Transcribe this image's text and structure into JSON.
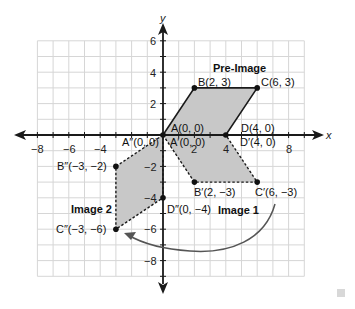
{
  "diagram": {
    "type": "coordinate-plane-transformation",
    "axes": {
      "x_label": "x",
      "y_label": "y",
      "x_ticks": [
        {
          "value": -8,
          "label": "−8"
        },
        {
          "value": -6,
          "label": "−6"
        },
        {
          "value": -4,
          "label": "−4"
        },
        {
          "value": 2,
          "label": "2"
        },
        {
          "value": 4,
          "label": "4"
        },
        {
          "value": 8,
          "label": "8"
        }
      ],
      "y_ticks": [
        {
          "value": 6,
          "label": "6"
        },
        {
          "value": 4,
          "label": "4"
        },
        {
          "value": 2,
          "label": "2"
        },
        {
          "value": -2,
          "label": "−2"
        },
        {
          "value": -4,
          "label": "−4"
        },
        {
          "value": -6,
          "label": "−6"
        },
        {
          "value": -8,
          "label": "−8"
        }
      ],
      "grid_x_range": [
        -8,
        9
      ],
      "grid_y_range": [
        -9,
        6
      ]
    },
    "shapes": {
      "pre_image": {
        "title": "Pre-Image",
        "vertices": [
          {
            "name": "A",
            "x": 0,
            "y": 0,
            "label": "A(0, 0)"
          },
          {
            "name": "B",
            "x": 2,
            "y": 3,
            "label": "B(2, 3)"
          },
          {
            "name": "C",
            "x": 6,
            "y": 3,
            "label": "C(6, 3)"
          },
          {
            "name": "D",
            "x": 4,
            "y": 0,
            "label": "D(4, 0)"
          }
        ]
      },
      "image_1": {
        "title": "Image 1",
        "vertices": [
          {
            "name": "A'",
            "x": 0,
            "y": 0,
            "label": "A′(0, 0)"
          },
          {
            "name": "B'",
            "x": 2,
            "y": -3,
            "label": "B′(2, −3)"
          },
          {
            "name": "C'",
            "x": 6,
            "y": -3,
            "label": "C′(6, −3)"
          },
          {
            "name": "D'",
            "x": 4,
            "y": 0,
            "label": "D′(4, 0)"
          }
        ]
      },
      "image_2": {
        "title": "Image 2",
        "vertices": [
          {
            "name": "A''",
            "x": 0,
            "y": 0,
            "label": "A″(0, 0)"
          },
          {
            "name": "B''",
            "x": -3,
            "y": -2,
            "label": "B″(−3, −2)"
          },
          {
            "name": "C''",
            "x": -3,
            "y": -6,
            "label": "C″(−3, −6)"
          },
          {
            "name": "D''",
            "x": 0,
            "y": -4,
            "label": "D″(0, −4)"
          }
        ]
      }
    },
    "colors": {
      "fill": "#c8c8c8",
      "grid": "#d4d4d4",
      "axis": "#1a1a1a",
      "arc": "#555555"
    }
  }
}
